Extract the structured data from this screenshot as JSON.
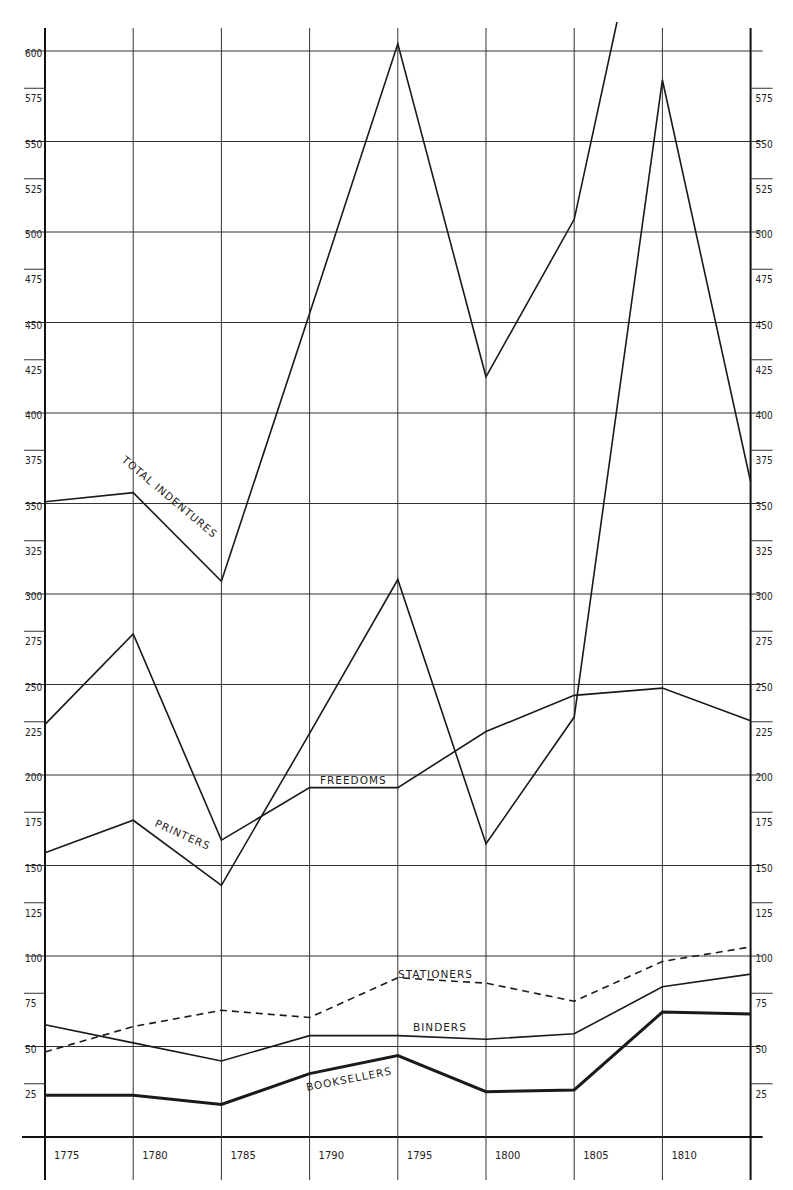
{
  "chart_data": {
    "type": "line",
    "title": "",
    "xlabel": "",
    "ylabel": "",
    "x": [
      1775,
      1780,
      1785,
      1790,
      1795,
      1800,
      1805,
      1810,
      1815
    ],
    "x_tick_labels": [
      "1775",
      "1780",
      "1785",
      "1790",
      "1795",
      "1800",
      "1805",
      "1810"
    ],
    "y_tick_labels_left": [
      "25",
      "50",
      "75",
      "100",
      "125",
      "150",
      "175",
      "200",
      "225",
      "250",
      "275",
      "300",
      "325",
      "350",
      "375",
      "400",
      "425",
      "450",
      "475",
      "500",
      "525",
      "550",
      "575",
      "600"
    ],
    "y_tick_labels_right": [
      "25",
      "50",
      "75",
      "100",
      "125",
      "150",
      "175",
      "200",
      "225",
      "250",
      "275",
      "300",
      "325",
      "350",
      "375",
      "400",
      "425",
      "450",
      "475",
      "500",
      "525",
      "550",
      "575"
    ],
    "ylim": [
      0,
      620
    ],
    "grid": true,
    "gridlines_every": 50,
    "legend_position": "inline labels on lines",
    "series": [
      {
        "name": "TOTAL INDENTURES",
        "style": "solid",
        "values": [
          351,
          356,
          307,
          455,
          604,
          420,
          507,
          640,
          null
        ],
        "note": "line exits top of chart after 1805"
      },
      {
        "name": "PRINTERS",
        "style": "solid",
        "values": [
          157,
          175,
          139,
          223,
          308,
          162,
          232,
          584,
          362
        ]
      },
      {
        "name": "FREEDOMS",
        "style": "solid",
        "values": [
          228,
          278,
          164,
          193,
          193,
          224,
          244,
          248,
          230
        ]
      },
      {
        "name": "STATIONERS",
        "style": "dashed",
        "values": [
          47,
          61,
          70,
          66,
          88,
          85,
          75,
          97,
          105
        ]
      },
      {
        "name": "BINDERS",
        "style": "solid",
        "values": [
          62,
          52,
          42,
          56,
          56,
          54,
          57,
          83,
          90
        ]
      },
      {
        "name": "BOOKSELLERS",
        "style": "thick",
        "values": [
          23,
          23,
          18,
          35,
          45,
          25,
          26,
          69,
          68
        ]
      }
    ]
  },
  "labels": {
    "total_indentures": "TOTAL INDENTURES",
    "printers": "PRINTERS",
    "freedoms": "FREEDOMS",
    "stationers": "STATIONERS",
    "binders": "BINDERS",
    "booksellers": "BOOKSELLERS"
  },
  "colors": {
    "ink": "#1a1a1a",
    "grid": "#333333",
    "paper": "#ffffff"
  }
}
